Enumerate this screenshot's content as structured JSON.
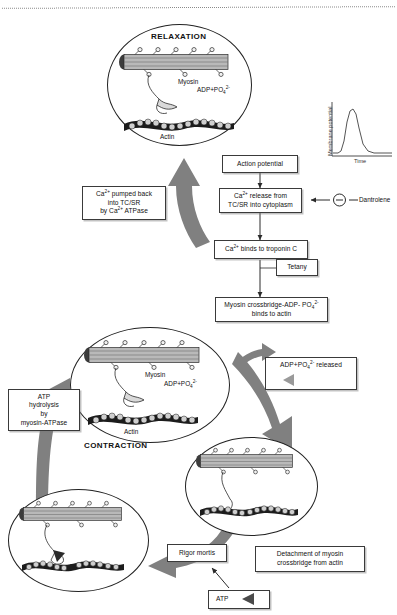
{
  "diagram": {
    "top_divider": "dotted-rule",
    "accent_arrow_color": "#808080",
    "box_border_color": "#3a3a3a"
  },
  "cells": {
    "relaxation": {
      "title": "RELAXATION",
      "myosin_label": "Myosin",
      "actin_label": "Actin",
      "product_label": "ADP+PO4 2-",
      "product_html": "ADP+PO<sub>4</sub><sup>2-</sup>"
    },
    "contraction": {
      "title": "CONTRACTION",
      "myosin_label": "Myosin",
      "actin_label": "Actin",
      "product_label": "ADP+PO4 2-",
      "product_html": "ADP+PO<sub>4</sub><sup>2-</sup>"
    },
    "powerstroke": {
      "title": ""
    },
    "rigor": {
      "title": ""
    }
  },
  "flow": {
    "action_potential": "Action potential",
    "ca_release": "Ca<sup>2+</sup> release from<br>TC/SR into cytoplasm",
    "ca_release_text": "Ca2+ release from TC/SR into cytoplasm",
    "ca_troponin": "Ca<sup>2+</sup> binds to troponin C",
    "ca_troponin_text": "Ca2+ binds to troponin C",
    "tetany": "Tetany",
    "crossbridge_binds": "Myosin crossbridge-ADP- PO<sub>4</sub><sup>2-</sup><br>binds to actin",
    "crossbridge_binds_text": "Myosin crossbridge-ADP- PO4 2- binds to actin",
    "adp_released": "ADP+PO<sub>4</sub><sup>2-</sup> released",
    "adp_released_text": "ADP+PO4 2- released",
    "detachment": "Detachment of myosin<br>crossbridge from actin",
    "detachment_text": "Detachment of myosin crossbridge from actin",
    "atp": "ATP",
    "rigor_mortis": "Rigor mortis",
    "atp_hydrolysis": "ATP<br>hydrolysis<br>by<br>myosin-ATPase",
    "atp_hydrolysis_text": "ATP hydrolysis by myosin-ATPase",
    "ca_pumped": "Ca<sup>2+</sup> pumped back<br>into TC/SR<br>by Ca<sup>2+</sup> ATPase",
    "ca_pumped_text": "Ca2+ pumped back into TC/SR by Ca2+ ATPase"
  },
  "drug": {
    "name": "Dantrolene",
    "effect_symbol": "−",
    "effect": "inhibition"
  },
  "inset_chart": {
    "type": "line",
    "title": "",
    "xlabel": "Time",
    "ylabel": "Membrane potential",
    "grid": false,
    "legend": null,
    "x": [
      0,
      8,
      14,
      18,
      22,
      26,
      30,
      34,
      38,
      44,
      52,
      62,
      75,
      100
    ],
    "y": [
      5,
      5,
      7,
      28,
      70,
      88,
      90,
      82,
      55,
      24,
      10,
      6,
      6,
      6
    ],
    "xlim": [
      0,
      100
    ],
    "ylim": [
      0,
      100
    ],
    "annotations": [
      "action potential spike"
    ]
  }
}
